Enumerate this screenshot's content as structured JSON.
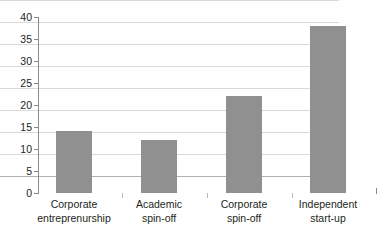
{
  "chart_data": {
    "type": "bar",
    "title": "",
    "subtitle": "",
    "xlabel": "",
    "ylabel": "",
    "ylim": [
      0,
      40
    ],
    "yticks": [
      0,
      5,
      10,
      15,
      20,
      25,
      30,
      35,
      40
    ],
    "ytick_labels": [
      "0",
      "5",
      "10",
      "15",
      "20",
      "25",
      "30",
      "35",
      "40"
    ],
    "grid": true,
    "legend": null,
    "categories": [
      "Corporate entreprenurship",
      "Academic spin-off",
      "Corporate spin-off",
      "Independent start-up"
    ],
    "category_lines": [
      [
        "Corporate",
        "entreprenurship"
      ],
      [
        "Academic",
        "spin-off"
      ],
      [
        "Corporate",
        "spin-off"
      ],
      [
        "Independent",
        "start-up"
      ]
    ],
    "values": [
      14,
      12,
      22,
      38
    ],
    "series": [
      {
        "name": "",
        "values": [
          14,
          12,
          22,
          38
        ]
      }
    ],
    "colors": {
      "bar": "#909090",
      "gridline": "#d9d9d9",
      "axis": "#8a8a8a",
      "text": "#231f20",
      "background": "#ffffff"
    }
  }
}
